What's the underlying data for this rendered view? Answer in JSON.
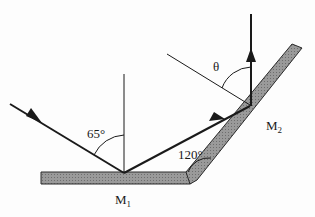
{
  "diagram": {
    "type": "optics-two-mirror-reflection",
    "mirrors": [
      {
        "id": "M1",
        "label": "M",
        "subscript": "1",
        "orientation": "horizontal"
      },
      {
        "id": "M2",
        "label": "M",
        "subscript": "2",
        "orientation": "inclined"
      }
    ],
    "angles": {
      "incidence_label": "65°",
      "mirror_angle_label": "120°",
      "unknown_label": "θ"
    },
    "rays": [
      "incident",
      "reflected-from-M1",
      "reflected-from-M2"
    ],
    "colors": {
      "line": "#1a1a1a",
      "mirror_fill": "#8a8a8a",
      "mirror_edge": "#2a2a2a"
    }
  }
}
